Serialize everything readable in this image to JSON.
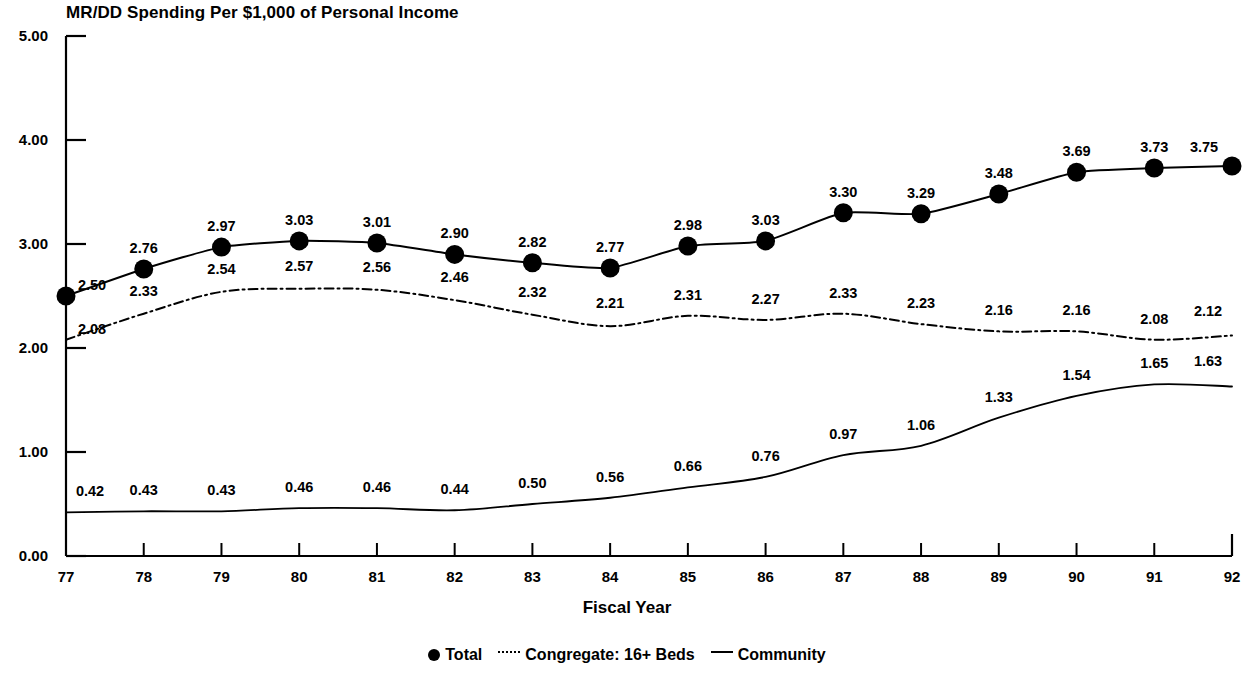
{
  "chart_data": {
    "type": "line",
    "title": "MR/DD Spending Per $1,000 of Personal Income",
    "xlabel": "Fiscal Year",
    "ylabel": "",
    "categories": [
      "77",
      "78",
      "79",
      "80",
      "81",
      "82",
      "83",
      "84",
      "85",
      "86",
      "87",
      "88",
      "89",
      "90",
      "91",
      "92"
    ],
    "x": [
      77,
      78,
      79,
      80,
      81,
      82,
      83,
      84,
      85,
      86,
      87,
      88,
      89,
      90,
      91,
      92
    ],
    "ylim": [
      0.0,
      5.0
    ],
    "yticks": [
      "0.00",
      "1.00",
      "2.00",
      "3.00",
      "4.00",
      "5.00"
    ],
    "ytick_values": [
      0.0,
      1.0,
      2.0,
      3.0,
      4.0,
      5.0
    ],
    "grid": false,
    "legend_position": "bottom",
    "series": [
      {
        "name": "Total",
        "style": "solid-with-dot-markers",
        "values": [
          2.5,
          2.76,
          2.97,
          3.03,
          3.01,
          2.9,
          2.82,
          2.77,
          2.98,
          3.03,
          3.3,
          3.29,
          3.48,
          3.69,
          3.73,
          3.75
        ],
        "labels": [
          "2.50",
          "2.76",
          "2.97",
          "3.03",
          "3.01",
          "2.90",
          "2.82",
          "2.77",
          "2.98",
          "3.03",
          "3.30",
          "3.29",
          "3.48",
          "3.69",
          "3.73",
          "3.75"
        ]
      },
      {
        "name": "Congregate: 16+ Beds",
        "style": "dash-dot",
        "values": [
          2.08,
          2.33,
          2.54,
          2.57,
          2.56,
          2.46,
          2.32,
          2.21,
          2.31,
          2.27,
          2.33,
          2.23,
          2.16,
          2.16,
          2.08,
          2.12
        ],
        "labels": [
          "2.08",
          "2.33",
          "2.54",
          "2.57",
          "2.56",
          "2.46",
          "2.32",
          "2.21",
          "2.31",
          "2.27",
          "2.33",
          "2.23",
          "2.16",
          "2.16",
          "2.08",
          "2.12"
        ]
      },
      {
        "name": "Community",
        "style": "solid",
        "values": [
          0.42,
          0.43,
          0.43,
          0.46,
          0.46,
          0.44,
          0.5,
          0.56,
          0.66,
          0.76,
          0.97,
          1.06,
          1.33,
          1.54,
          1.65,
          1.63
        ],
        "labels": [
          "0.42",
          "0.43",
          "0.43",
          "0.46",
          "0.46",
          "0.44",
          "0.50",
          "0.56",
          "0.66",
          "0.76",
          "0.97",
          "1.06",
          "1.33",
          "1.54",
          "1.65",
          "1.63"
        ]
      }
    ]
  },
  "legend": {
    "items": [
      {
        "label": "Total",
        "marker": "filled-circle-marker"
      },
      {
        "label": "Congregate: 16+ Beds",
        "marker": "dash-dot-line-marker"
      },
      {
        "label": "Community",
        "marker": "solid-line-marker"
      }
    ]
  },
  "colors": {
    "ink": "#000000",
    "background": "#ffffff"
  }
}
